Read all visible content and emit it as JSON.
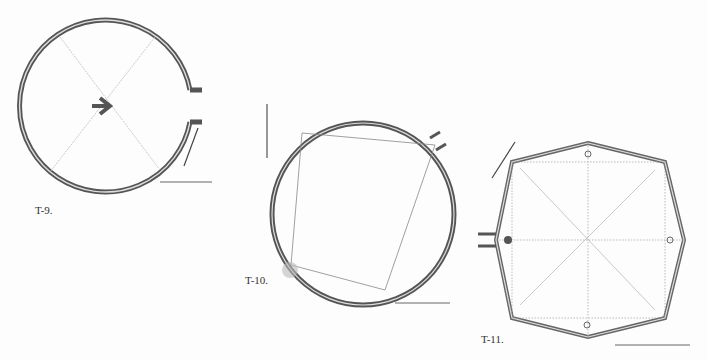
{
  "figures": [
    {
      "id": "t9",
      "label": "T-9.",
      "shape": "circle-with-entrance",
      "description": "Circular ring plan with east entrance, diagonal cross-lines and central arrow-shaped feature"
    },
    {
      "id": "t10",
      "label": "T-10.",
      "shape": "circle-with-inscribed-quadrilateral",
      "description": "Circular ring plan with inscribed quadrilateral, entrance at NE and rubble at SW"
    },
    {
      "id": "t11",
      "label": "T-11.",
      "shape": "octagon",
      "description": "Octagonal enclosure with western entrance, post holes and dotted grid lines"
    }
  ],
  "colors": {
    "wall": "#555555",
    "wall_light": "#9a9a9a",
    "guide": "#b0b0b0",
    "text": "#333333"
  }
}
